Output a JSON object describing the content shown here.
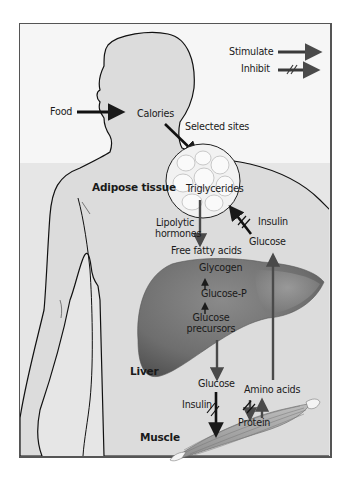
{
  "legend": {
    "stimulate_label": "Stimulate",
    "inhibit_label": "Inhibit"
  },
  "labels": {
    "food": "Food",
    "calories": "Calories",
    "selected_sites": "Selected sites",
    "adipose_tissue": "Adipose tissue",
    "triglycerides": "Triglycerides",
    "lipolytic_line1": "Lipolytic",
    "lipolytic_line2": "hormones",
    "insulin_adipose": "Insulin",
    "free_fatty_acids": "Free fatty acids",
    "glucose_adipose": "Glucose",
    "glycogen": "Glycogen",
    "glucose_p": "Glucose-P",
    "glucose_precursors_line1": "Glucose",
    "glucose_precursors_line2": "precursors",
    "liver": "Liver",
    "glucose_liver": "Glucose",
    "amino_acids": "Amino acids",
    "insulin_muscle": "Insulin",
    "protein": "Protein",
    "muscle": "Muscle"
  },
  "colors": {
    "frame_border": "#555555",
    "upper_background": "#f6f6f6",
    "lower_band": "#e6e6e6",
    "body_fill": "#dcdcdc",
    "liver_fill": "#707070",
    "arrow_dark": "#1a1a1a",
    "arrow_gray": "#4a4a4a"
  }
}
